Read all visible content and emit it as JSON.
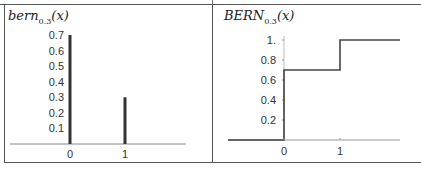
{
  "chart_data": [
    {
      "type": "bar",
      "title": "bern_0.3(x)",
      "title_main": "bern",
      "title_sub": "0.3",
      "title_arg": "(x)",
      "xlabel": "",
      "ylabel": "",
      "categories": [
        "0",
        "1"
      ],
      "values": [
        0.7,
        0.3
      ],
      "yticks": [
        "0.1",
        "0.2",
        "0.3",
        "0.4",
        "0.5",
        "0.6",
        "0.7"
      ],
      "xticks": [
        "0",
        "1"
      ],
      "ylim": [
        0,
        0.7
      ],
      "grid": false,
      "legend": null
    },
    {
      "type": "line",
      "step": true,
      "title": "BERN_0.3(x)",
      "title_main": "BERN",
      "title_sub": "0.3",
      "title_arg": "(x)",
      "xlabel": "",
      "ylabel": "",
      "x": [
        -1,
        0,
        0,
        1,
        1,
        2
      ],
      "y": [
        0,
        0,
        0.7,
        0.7,
        1.0,
        1.0
      ],
      "yticks": [
        "0.2",
        "0.4",
        "0.6",
        "0.8",
        "1."
      ],
      "xticks": [
        "0",
        "1"
      ],
      "ylim": [
        0,
        1.0
      ],
      "grid": false,
      "legend": null
    }
  ]
}
